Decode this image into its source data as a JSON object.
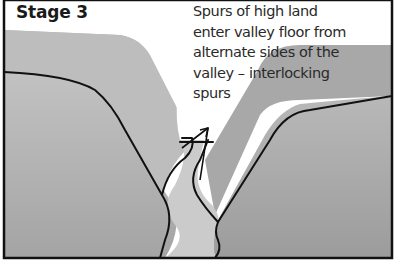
{
  "figure": {
    "title": "Stage 3",
    "caption_lines": [
      "Spurs of high land",
      "enter valley floor from",
      "alternate sides of the",
      "valley – interlocking",
      "spurs"
    ],
    "colors": {
      "background": "#ffffff",
      "land_light": "#b4b4b4",
      "land_dark": "#9a9a9a",
      "river": "#c8c8c8",
      "outline": "#111111"
    }
  }
}
